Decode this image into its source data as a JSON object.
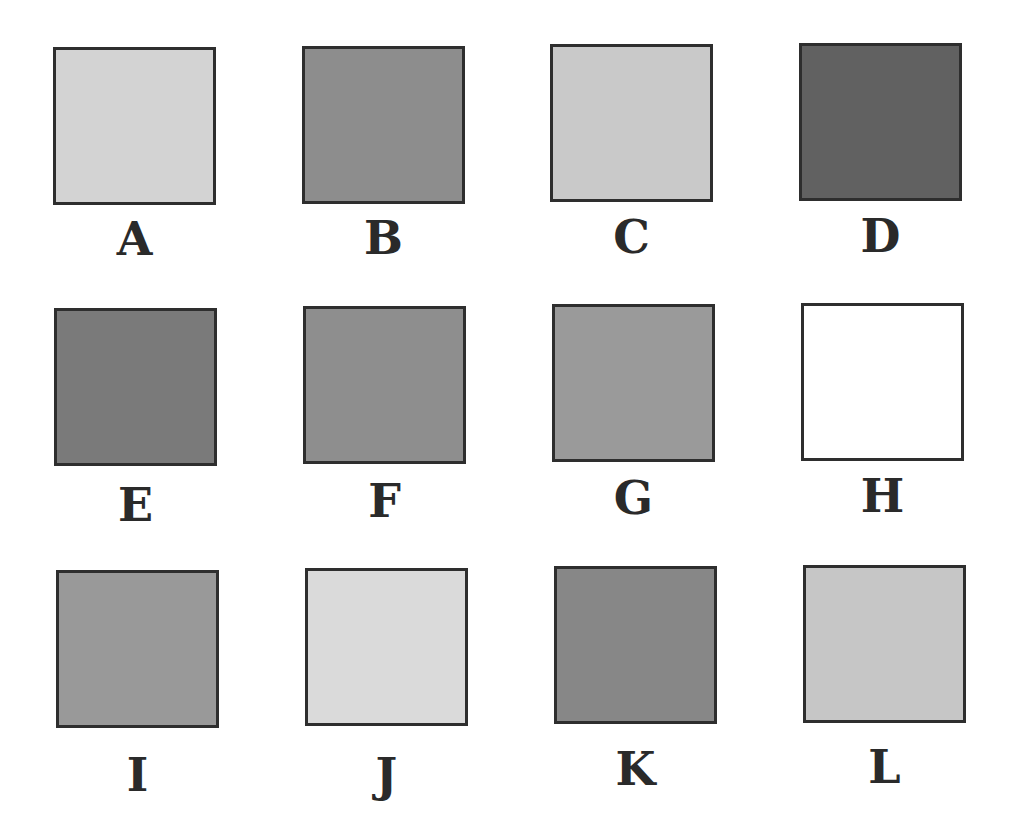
{
  "swatches": [
    {
      "label": "A",
      "color": "#d3d3d3",
      "x": 53,
      "y": 47,
      "lx": 53,
      "ly": 216
    },
    {
      "label": "B",
      "color": "#8d8d8d",
      "x": 302,
      "y": 46,
      "lx": 302,
      "ly": 215
    },
    {
      "label": "C",
      "color": "#c9c9c9",
      "x": 550,
      "y": 44,
      "lx": 550,
      "ly": 214
    },
    {
      "label": "D",
      "color": "#616161",
      "x": 799,
      "y": 43,
      "lx": 799,
      "ly": 213
    },
    {
      "label": "E",
      "color": "#7a7a7a",
      "x": 54,
      "y": 308,
      "lx": 54,
      "ly": 482
    },
    {
      "label": "F",
      "color": "#8e8e8e",
      "x": 303,
      "y": 306,
      "lx": 303,
      "ly": 478
    },
    {
      "label": "G",
      "color": "#9a9a9a",
      "x": 552,
      "y": 304,
      "lx": 552,
      "ly": 475
    },
    {
      "label": "H",
      "color": "#ffffff",
      "x": 801,
      "y": 303,
      "lx": 801,
      "ly": 473
    },
    {
      "label": "I",
      "color": "#999999",
      "x": 56,
      "y": 570,
      "lx": 56,
      "ly": 752
    },
    {
      "label": "J",
      "color": "#dadada",
      "x": 305,
      "y": 568,
      "lx": 305,
      "ly": 752
    },
    {
      "label": "K",
      "color": "#878787",
      "x": 554,
      "y": 566,
      "lx": 554,
      "ly": 746
    },
    {
      "label": "L",
      "color": "#c6c6c6",
      "x": 803,
      "y": 565,
      "lx": 803,
      "ly": 744
    }
  ],
  "colors": {
    "border": "#2e2e2e",
    "label": "#2a2a2a",
    "background": "#ffffff"
  }
}
